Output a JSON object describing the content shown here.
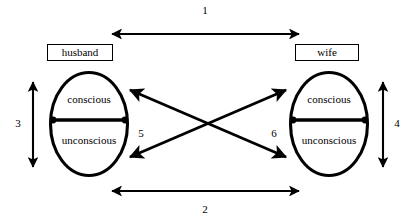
{
  "diagram": {
    "colors": {
      "stroke": "#000000",
      "background": "#ffffff",
      "text": "#000000"
    },
    "nodes": [
      {
        "id": "husband",
        "label": "husband",
        "side": "left",
        "regions": {
          "upper": "conscious",
          "lower": "unconscious"
        }
      },
      {
        "id": "wife",
        "label": "wife",
        "side": "right",
        "regions": {
          "upper": "conscious",
          "lower": "unconscious"
        }
      }
    ],
    "arrows": [
      {
        "id": "arrow-1",
        "number": "1",
        "orientation": "horizontal",
        "position": "top",
        "heads": "both",
        "from": "husband-conscious",
        "to": "wife-conscious"
      },
      {
        "id": "arrow-2",
        "number": "2",
        "orientation": "horizontal",
        "position": "bottom",
        "heads": "both",
        "from": "husband-unconscious",
        "to": "wife-unconscious"
      },
      {
        "id": "arrow-3",
        "number": "3",
        "orientation": "vertical",
        "position": "left",
        "heads": "both",
        "from": "husband-conscious",
        "to": "husband-unconscious"
      },
      {
        "id": "arrow-4",
        "number": "4",
        "orientation": "vertical",
        "position": "right",
        "heads": "both",
        "from": "wife-conscious",
        "to": "wife-unconscious"
      },
      {
        "id": "arrow-5",
        "number": "5",
        "orientation": "diagonal",
        "position": "center-left",
        "heads": "both",
        "from": "husband-conscious",
        "to": "wife-unconscious"
      },
      {
        "id": "arrow-6",
        "number": "6",
        "orientation": "diagonal",
        "position": "center-right",
        "heads": "both",
        "from": "husband-unconscious",
        "to": "wife-conscious"
      }
    ]
  }
}
